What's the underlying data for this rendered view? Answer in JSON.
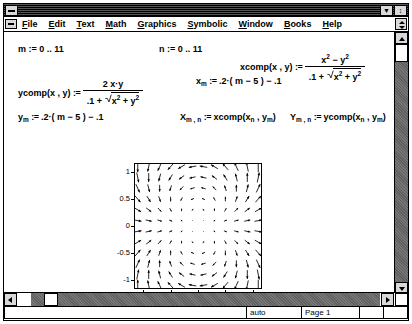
{
  "window": {
    "title": "",
    "system_menu_icon": "system-menu-icon",
    "minimize_label": "▼",
    "maximize_label": "↕"
  },
  "menubar": {
    "items": [
      {
        "label": "File",
        "accel": "F"
      },
      {
        "label": "Edit",
        "accel": "E"
      },
      {
        "label": "Text",
        "accel": "T"
      },
      {
        "label": "Math",
        "accel": "M"
      },
      {
        "label": "Graphics",
        "accel": "G"
      },
      {
        "label": "Symbolic",
        "accel": "S"
      },
      {
        "label": "Window",
        "accel": "W"
      },
      {
        "label": "Books",
        "accel": "B"
      },
      {
        "label": "Help",
        "accel": "H"
      }
    ]
  },
  "document": {
    "range_m": {
      "var": "m",
      "assign": ":=",
      "start": "0",
      "ellipsis": "..",
      "end": "11"
    },
    "range_n": {
      "var": "n",
      "assign": ":=",
      "start": "0",
      "ellipsis": "..",
      "end": "11"
    },
    "xcomp": {
      "name": "xcomp",
      "args": "x , y",
      "assign": ":=",
      "numerator_x": "x",
      "numerator_x_pow": "2",
      "numerator_op": "−",
      "numerator_y": "y",
      "numerator_y_pow": "2",
      "den_const": ".1",
      "den_op": "+",
      "den_rad_x": "x",
      "den_rad_x_pow": "2",
      "den_rad_op": "+",
      "den_rad_y": "y",
      "den_rad_y_pow": "2"
    },
    "ycomp": {
      "name": "ycomp",
      "args": "x , y",
      "assign": ":=",
      "numerator": "2 x·y",
      "den_const": ".1",
      "den_op": "+",
      "den_rad_x": "x",
      "den_rad_x_pow": "2",
      "den_rad_op": "+",
      "den_rad_y": "y",
      "den_rad_y_pow": "2"
    },
    "x_def": {
      "var": "x",
      "sub": "m",
      "assign": ":=",
      "rhs": ".2·( m − 5 ) − .1"
    },
    "y_def": {
      "var": "y",
      "sub": "m",
      "assign": ":=",
      "rhs": ".2·( m − 5 ) − .1"
    },
    "X_def": {
      "var": "X",
      "sub": "m , n",
      "assign": ":=",
      "fn": "xcomp",
      "arg1": "x",
      "arg1sub": "n",
      "argsep": " , ",
      "arg2": "y",
      "arg2sub": "m"
    },
    "Y_def": {
      "var": "Y",
      "sub": "m , n",
      "assign": ":=",
      "fn": "ycomp",
      "arg1": "x",
      "arg1sub": "n",
      "argsep": " , ",
      "arg2": "y",
      "arg2sub": "m"
    }
  },
  "statusbar": {
    "message": "",
    "auto": "auto",
    "page": "Page 1",
    "cell4": "",
    "cell5": ""
  },
  "chart_data": {
    "type": "scatter",
    "render": "vector-field",
    "title": "",
    "xlabel": "X , Y",
    "ylabel": "",
    "xlim": [
      -1.15,
      1.15
    ],
    "ylim": [
      -1.15,
      1.15
    ],
    "grid": false,
    "legend": null,
    "xticks": [
      -1,
      -0.5,
      0,
      0.5,
      1
    ],
    "xticklabels": [
      "-1",
      "-0.5",
      "0",
      "0.5",
      "1"
    ],
    "yticks": [
      -1,
      -0.5,
      0,
      0.5,
      1
    ],
    "yticklabels": [
      "-1",
      "-0.5",
      "0",
      "0.5",
      "1"
    ],
    "grid_n": 12,
    "x_values": [
      -1.1,
      -0.9,
      -0.7,
      -0.5,
      -0.3,
      -0.1,
      0.1,
      0.3,
      0.5,
      0.7,
      0.9,
      1.1
    ],
    "y_values": [
      -1.1,
      -0.9,
      -0.7,
      -0.5,
      -0.3,
      -0.1,
      0.1,
      0.3,
      0.5,
      0.7,
      0.9,
      1.1
    ],
    "u_formula": "(x^2 - y^2) / (0.1 + sqrt(x^2 + y^2))",
    "v_formula": "(2*x*y) / (0.1 + sqrt(x^2 + y^2))",
    "arrow_scale": 0.5
  }
}
